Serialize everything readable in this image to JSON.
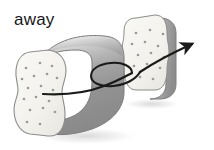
{
  "figure": {
    "caption_label": "away",
    "background_color": "#ffffff",
    "line_color": "#1a1a1a",
    "stroke_color": "#6e6e6e"
  },
  "colors": {
    "face_light": "#f4f3ef",
    "face_edge": "#8c8c8c",
    "body_highlight": "#e2e2e2",
    "body_mid": "#b8b8b8",
    "body_dark": "#8f8f8f",
    "body_darkest": "#7c7c7c",
    "speckle": "#9a9a9a",
    "shadow": "#e8e8e8",
    "arrow": "#1a1a1a"
  },
  "objects": {
    "left_block": {
      "name": "left-block",
      "face_label": "porous cut face",
      "speckle_count": 18
    },
    "right_block": {
      "name": "right-block",
      "face_label": "porous cut face",
      "speckle_count": 14
    },
    "arrow": {
      "name": "motion-arrow",
      "meaning": "away",
      "has_loop": true,
      "head_position": "upper-right"
    }
  },
  "speckles": {
    "left": [
      [
        26,
        68
      ],
      [
        40,
        63
      ],
      [
        52,
        66
      ],
      [
        22,
        79
      ],
      [
        34,
        76
      ],
      [
        47,
        74
      ],
      [
        57,
        78
      ],
      [
        28,
        88
      ],
      [
        41,
        86
      ],
      [
        53,
        90
      ],
      [
        24,
        99
      ],
      [
        36,
        97
      ],
      [
        49,
        101
      ],
      [
        30,
        110
      ],
      [
        43,
        108
      ],
      [
        55,
        112
      ],
      [
        27,
        122
      ],
      [
        40,
        124
      ]
    ],
    "right": [
      [
        136,
        33
      ],
      [
        150,
        30
      ],
      [
        163,
        34
      ],
      [
        132,
        44
      ],
      [
        145,
        42
      ],
      [
        158,
        46
      ],
      [
        138,
        55
      ],
      [
        151,
        53
      ],
      [
        164,
        57
      ],
      [
        134,
        66
      ],
      [
        147,
        64
      ],
      [
        160,
        68
      ],
      [
        140,
        77
      ],
      [
        153,
        79
      ]
    ]
  }
}
